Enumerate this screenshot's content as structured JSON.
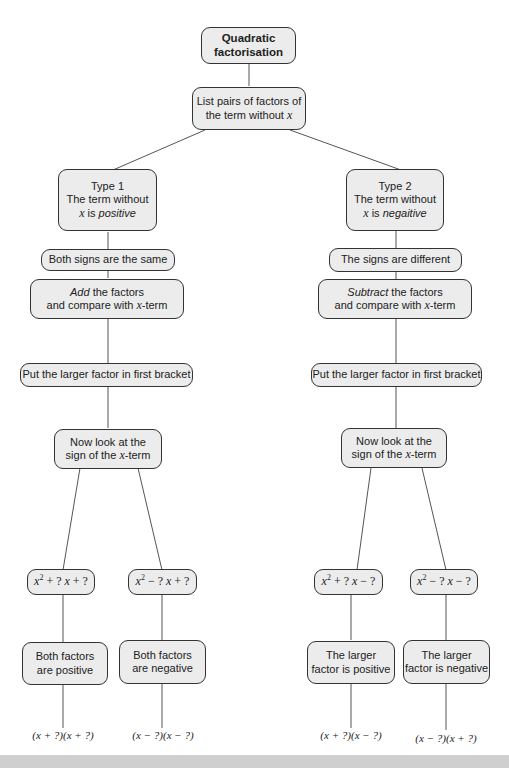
{
  "title": {
    "line1": "Quadratic",
    "line2": "factorisation"
  },
  "root_step": {
    "line1": "List pairs of factors of",
    "line2_prefix": "the term without ",
    "var": "x"
  },
  "type1": {
    "heading": "Type 1",
    "line2": "The term without",
    "var": "x",
    "is": " is ",
    "sign": "positive",
    "signs": "Both signs are the same",
    "op": "Add",
    "op_rest": " the factors",
    "compare_prefix": "and compare with ",
    "compare_suffix": "-term",
    "bracket": "Put the larger factor in first bracket",
    "look1": "Now look at the",
    "look2_prefix": "sign of the ",
    "look2_suffix": "-term",
    "branches": [
      {
        "formula_a": "x",
        "formula_b": " + ? ",
        "formula_c": "x",
        "formula_d": " + ?",
        "desc1": "Both factors",
        "desc2": "are positive",
        "result": "(x + ?)(x + ?)"
      },
      {
        "formula_a": "x",
        "formula_b": " − ? ",
        "formula_c": "x",
        "formula_d": " + ?",
        "desc1": "Both factors",
        "desc2": "are negative",
        "result": "(x − ?)(x − ?)"
      }
    ]
  },
  "type2": {
    "heading": "Type 2",
    "line2": "The term without",
    "var": "x",
    "is": " is ",
    "sign": "negaitive",
    "signs": "The signs are different",
    "op": "Subtract",
    "op_rest": " the factors",
    "compare_prefix": "and compare with ",
    "compare_suffix": "-term",
    "bracket": "Put the larger factor in first bracket",
    "look1": "Now look at the",
    "look2_prefix": "sign of the ",
    "look2_suffix": "-term",
    "branches": [
      {
        "formula_a": "x",
        "formula_b": " + ? ",
        "formula_c": "x",
        "formula_d": " − ?",
        "desc1": "The larger",
        "desc2": "factor is positive",
        "result": "(x + ?)(x − ?)"
      },
      {
        "formula_a": "x",
        "formula_b": " − ? ",
        "formula_c": "x",
        "formula_d": " − ?",
        "desc1": "The larger",
        "desc2": "factor is negative",
        "result": "(x − ?)(x + ?)"
      }
    ]
  },
  "exponent": "2",
  "colors": {
    "node_fill": "#ececec",
    "border": "#333333",
    "band": "#cfcfcf"
  }
}
